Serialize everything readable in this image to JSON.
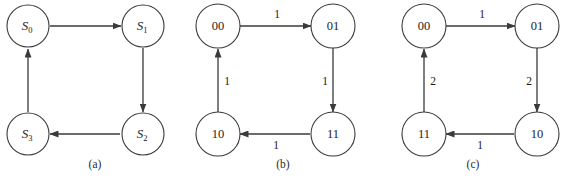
{
  "figure": {
    "background_color": "#ffffff",
    "stroke_color": "#3a3a3a",
    "text_color": "#1c1c1c",
    "panels": [
      {
        "id": "a",
        "caption": "(a)",
        "nodes": [
          {
            "id": "tl",
            "label": "S",
            "subscript": "0",
            "style": "state"
          },
          {
            "id": "tr",
            "label": "S",
            "subscript": "1",
            "style": "state"
          },
          {
            "id": "br",
            "label": "S",
            "subscript": "2",
            "style": "state"
          },
          {
            "id": "bl",
            "label": "S",
            "subscript": "3",
            "style": "state"
          }
        ],
        "edges": [
          {
            "from": "tl",
            "to": "tr",
            "label": "",
            "direction": "right"
          },
          {
            "from": "tr",
            "to": "br",
            "label": "",
            "direction": "down"
          },
          {
            "from": "br",
            "to": "bl",
            "label": "",
            "direction": "left"
          },
          {
            "from": "bl",
            "to": "tl",
            "label": "",
            "direction": "up"
          }
        ]
      },
      {
        "id": "b",
        "caption": "(b)",
        "nodes": [
          {
            "id": "tl",
            "label": "00",
            "subscript": "",
            "style": "plain"
          },
          {
            "id": "tr",
            "label": "01",
            "subscript": "",
            "style": "plain"
          },
          {
            "id": "br",
            "label": "11",
            "subscript": "",
            "style": "plain"
          },
          {
            "id": "bl",
            "label": "10",
            "subscript": "",
            "style": "plain"
          }
        ],
        "edges": [
          {
            "from": "tl",
            "to": "tr",
            "label": "1",
            "direction": "right"
          },
          {
            "from": "tr",
            "to": "br",
            "label": "1",
            "direction": "down"
          },
          {
            "from": "br",
            "to": "bl",
            "label": "1",
            "direction": "left"
          },
          {
            "from": "bl",
            "to": "tl",
            "label": "1",
            "direction": "up"
          }
        ]
      },
      {
        "id": "c",
        "caption": "(c)",
        "nodes": [
          {
            "id": "tl",
            "label": "00",
            "subscript": "",
            "style": "plain"
          },
          {
            "id": "tr",
            "label": "01",
            "subscript": "",
            "style": "plain"
          },
          {
            "id": "br",
            "label": "10",
            "subscript": "",
            "style": "plain"
          },
          {
            "id": "bl",
            "label": "11",
            "subscript": "",
            "style": "plain"
          }
        ],
        "edges": [
          {
            "from": "tl",
            "to": "tr",
            "label": "1",
            "direction": "right"
          },
          {
            "from": "tr",
            "to": "br",
            "label": "2",
            "direction": "down"
          },
          {
            "from": "br",
            "to": "bl",
            "label": "1",
            "direction": "left"
          },
          {
            "from": "bl",
            "to": "tl",
            "label": "2",
            "direction": "up"
          }
        ]
      }
    ]
  }
}
